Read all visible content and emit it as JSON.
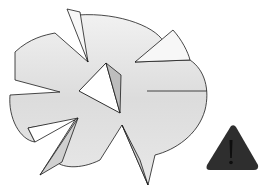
{
  "illustration": {
    "subject": "shattered speech bubble with warning sign",
    "colors": {
      "background": "#ffffff",
      "bubble_fill": "#e2e2e2",
      "bubble_light": "#f4f4f4",
      "outline": "#1a1a1a",
      "shard_shadow": "#bdbdbd",
      "warning_fill": "#2e2e2e",
      "warning_mark": "#111111"
    },
    "icons": [
      "broken-speech-bubble-icon",
      "warning-triangle-icon"
    ]
  }
}
